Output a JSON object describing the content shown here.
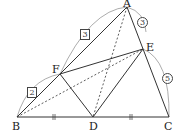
{
  "diagram": {
    "points": {
      "A": {
        "label": "A",
        "x": 127,
        "y": 7
      },
      "B": {
        "label": "B",
        "x": 17,
        "y": 117
      },
      "C": {
        "label": "C",
        "x": 169,
        "y": 117
      },
      "D": {
        "label": "D",
        "x": 93,
        "y": 117
      },
      "E": {
        "label": "E",
        "x": 143,
        "y": 49
      },
      "F": {
        "label": "F",
        "x": 60,
        "y": 74
      }
    },
    "ratio_labels": {
      "AF": "3",
      "FB": "2",
      "AE": "3",
      "EC": "5"
    },
    "segments_solid": [
      "AB",
      "AC",
      "BC",
      "FE",
      "FD",
      "DE"
    ],
    "segments_dashed": [
      "AD",
      "BE"
    ],
    "equal_marks": [
      "BD",
      "DC"
    ],
    "stroke_color": "#333333"
  }
}
